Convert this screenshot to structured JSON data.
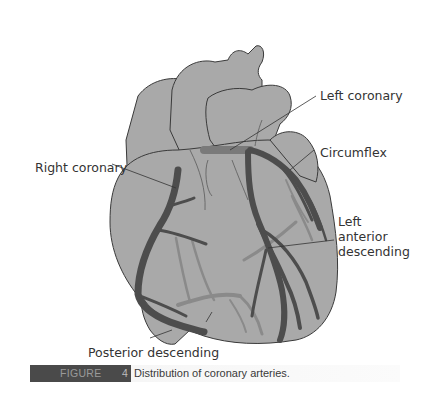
{
  "figure": {
    "label": "FIGURE",
    "number": "4",
    "caption": "Distribution of coronary arteries."
  },
  "labels": {
    "left_coronary": "Left coronary",
    "right_coronary": "Right coronary",
    "circumflex": "Circumflex",
    "lad_line1": "Left",
    "lad_line2": "anterior",
    "lad_line3": "descending",
    "posterior_descending": "Posterior descending"
  },
  "colors": {
    "heart_fill": "#a9a9a9",
    "outline": "#3a3a3a",
    "artery_front": "#4d4d4d",
    "artery_back": "#8a8a8a",
    "caption_tag": "#4a4a4a"
  }
}
